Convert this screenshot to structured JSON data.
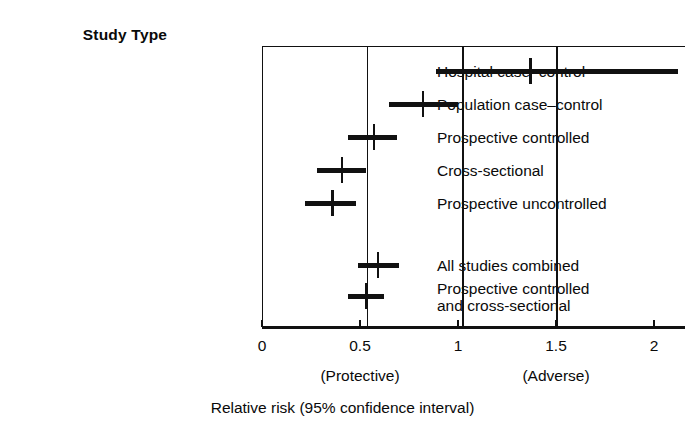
{
  "figure": {
    "column_header": "Study Type",
    "axis_title": "Relative risk (95% confidence interval)",
    "zone_labels": [
      {
        "text": "(Protective)",
        "at_value": 0.5
      },
      {
        "text": "(Adverse)",
        "at_value": 1.5
      }
    ],
    "ink_color": "#111111",
    "background_color": "#ffffff"
  },
  "chart_data": {
    "type": "bar",
    "subtype": "forest-plot",
    "title": "",
    "xlabel": "Relative risk (95% confidence interval)",
    "ylabel": "Study Type",
    "xlim": [
      0,
      2.2
    ],
    "ticks": [
      {
        "value": 0,
        "label": "0"
      },
      {
        "value": 0.5,
        "label": "0.5"
      },
      {
        "value": 1,
        "label": "1"
      },
      {
        "value": 1.5,
        "label": "1.5"
      },
      {
        "value": 2,
        "label": "2"
      }
    ],
    "grid": false,
    "legend": "none",
    "reference_lines": [
      {
        "value": 0.535,
        "name": "pooled-estimate-line"
      },
      {
        "value": 1.02,
        "name": "adverse-threshold-line"
      },
      {
        "value": 1.5,
        "name": "right-reference-line"
      }
    ],
    "categories": [
      "Hospital case-control",
      "Population case-control",
      "Prospective controlled",
      "Cross-sectional",
      "Prospective uncontrolled",
      "All studies combined",
      "Prospective controlled and cross-sectional"
    ],
    "values": [
      1.37,
      0.82,
      0.57,
      0.41,
      0.36,
      0.59,
      0.53
    ],
    "ci_low": [
      0.89,
      0.65,
      0.44,
      0.28,
      0.22,
      0.49,
      0.44
    ],
    "ci_high": [
      2.12,
      1.0,
      0.69,
      0.53,
      0.48,
      0.7,
      0.62
    ],
    "rows": [
      {
        "label": "Hospital case-control",
        "label_line1": "Hospital case–control",
        "label_line2": "",
        "estimate": 1.37,
        "ci_low": 0.89,
        "ci_high": 2.12,
        "group": "individual"
      },
      {
        "label": "Population case-control",
        "label_line1": "Population case–control",
        "label_line2": "",
        "estimate": 0.82,
        "ci_low": 0.65,
        "ci_high": 1.0,
        "group": "individual"
      },
      {
        "label": "Prospective controlled",
        "label_line1": "Prospective controlled",
        "label_line2": "",
        "estimate": 0.57,
        "ci_low": 0.44,
        "ci_high": 0.69,
        "group": "individual"
      },
      {
        "label": "Cross-sectional",
        "label_line1": "Cross-sectional",
        "label_line2": "",
        "estimate": 0.41,
        "ci_low": 0.28,
        "ci_high": 0.53,
        "group": "individual"
      },
      {
        "label": "Prospective uncontrolled",
        "label_line1": "Prospective uncontrolled",
        "label_line2": "",
        "estimate": 0.36,
        "ci_low": 0.22,
        "ci_high": 0.48,
        "group": "individual"
      },
      {
        "label": "All studies combined",
        "label_line1": "All studies combined",
        "label_line2": "",
        "estimate": 0.59,
        "ci_low": 0.49,
        "ci_high": 0.7,
        "group": "summary"
      },
      {
        "label": "Prospective controlled and cross-sectional",
        "label_line1": "Prospective controlled",
        "label_line2": "and cross-sectional",
        "estimate": 0.53,
        "ci_low": 0.44,
        "ci_high": 0.62,
        "group": "summary"
      }
    ]
  }
}
